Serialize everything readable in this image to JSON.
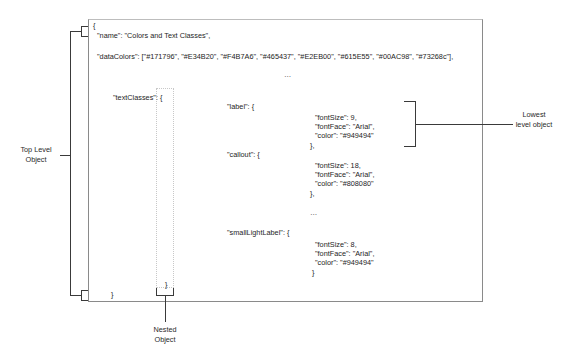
{
  "diagram": {
    "code_lines": {
      "open_brace": "{",
      "name_line": "\"name\": \"Colors and Text Classes\",",
      "data_colors_line": "\"dataColors\": [\"#171796\", \"#E34B20\", \"#F4B7A6\", \"#465437\", \"#E2EB00\", \"#615E55\", \"#00AC98\", \"#73268c\"],",
      "ellipsis_1": "…",
      "text_classes_line": "\"textClasses\": {",
      "close_brace_outer": "}",
      "close_brace_nested": "}"
    },
    "text_classes": [
      {
        "key_line": "\"label\": {",
        "props": [
          "\"fontSize\": 9,",
          "\"fontFace\": \"Arial\",",
          "\"color\": \"#949494\""
        ],
        "close": "},"
      },
      {
        "key_line": "\"callout\": {",
        "props": [
          "\"fontSize\": 18,",
          "\"fontFace\": \"Arial\",",
          "\"color\": \"#808080\""
        ],
        "close": "},"
      },
      {
        "key_line": "\"smallLightLabel\": {",
        "props": [
          "\"fontSize\": 8,",
          "\"fontFace\": \"Arial\",",
          "\"color\": \"#949494\""
        ],
        "close": "}"
      }
    ],
    "ellipsis_2": "…",
    "annotations": {
      "top_level": "Top Level Object",
      "lowest_level": "Lowest level object",
      "nested": "Nested Object"
    },
    "data_colors": [
      "#171796",
      "#E34B20",
      "#F4B7A6",
      "#465437",
      "#E2EB00",
      "#615E55",
      "#00AC98",
      "#73268c"
    ]
  }
}
